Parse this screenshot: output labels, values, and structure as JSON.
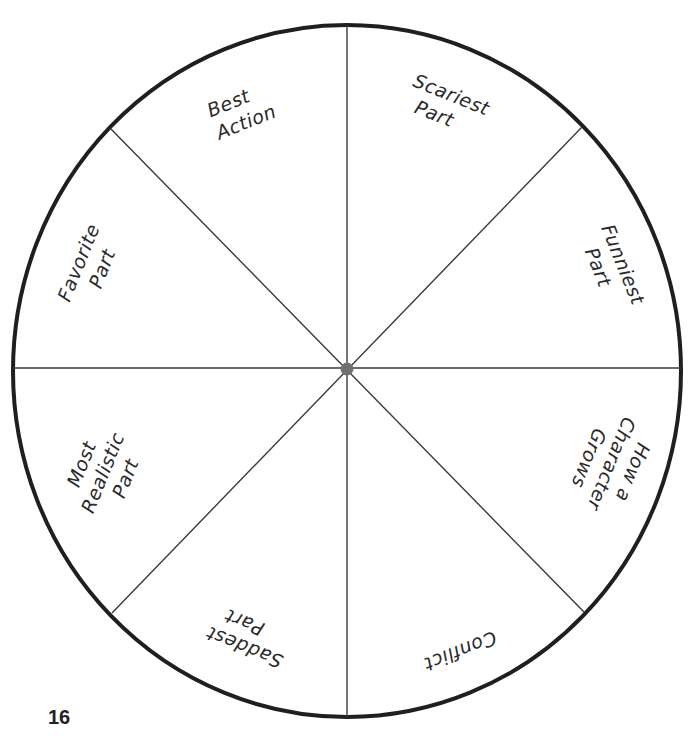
{
  "wheel": {
    "center": {
      "x": 347,
      "y": 369
    },
    "rx": 334,
    "ry": 346,
    "outline_color": "#1f1f1f",
    "spoke_color": "#3a3a3a",
    "hub_color": "#707070",
    "segments": [
      {
        "id": "best-action",
        "lines": [
          "Best",
          "Action"
        ]
      },
      {
        "id": "scariest-part",
        "lines": [
          "Scariest",
          "Part"
        ]
      },
      {
        "id": "funniest-part",
        "lines": [
          "Funniest",
          "Part"
        ]
      },
      {
        "id": "how-a-character-grows",
        "lines": [
          "How a",
          "Character",
          "Grows"
        ]
      },
      {
        "id": "conflict",
        "lines": [
          "Conflict"
        ]
      },
      {
        "id": "saddest-part",
        "lines": [
          "Saddest",
          "Part"
        ]
      },
      {
        "id": "most-realistic-part",
        "lines": [
          "Most",
          "Realistic",
          "Part"
        ]
      },
      {
        "id": "favorite-part",
        "lines": [
          "Favorite",
          "Part"
        ]
      }
    ]
  },
  "page": {
    "number": "16"
  }
}
